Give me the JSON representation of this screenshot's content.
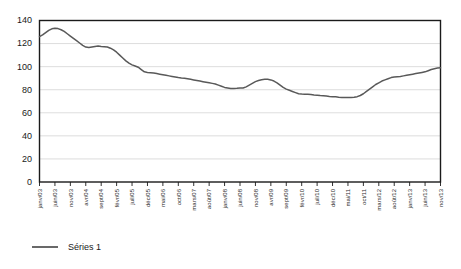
{
  "chart_data": {
    "type": "line",
    "title": "",
    "subtitle": "",
    "xlabel": "",
    "ylabel": "",
    "ylim": [
      0,
      140
    ],
    "yticks": [
      0,
      20,
      40,
      60,
      80,
      100,
      120,
      140
    ],
    "grid": true,
    "legend_position": "bottom-left",
    "x_tick_labels": [
      "janv/03",
      "juin/03",
      "nov/03",
      "avr/04",
      "sept/04",
      "févr/05",
      "juil/05",
      "déc/05",
      "mai/06",
      "oct/06",
      "mars/07",
      "août/07",
      "janv/08",
      "juin/08",
      "nov/08",
      "avr/09",
      "sept/09",
      "févr/10",
      "juil/10",
      "déc/10",
      "mai/11",
      "oct/11",
      "mars/12",
      "août/12",
      "janv/13",
      "juin/13",
      "nov/13"
    ],
    "x_tick_interval_months": 5,
    "series": [
      {
        "name": "Séries 1",
        "color": "#595959",
        "values": [
          126,
          127.5,
          129.5,
          131.5,
          132.8,
          133.2,
          133,
          132,
          130.5,
          128.5,
          126.5,
          124.5,
          122.5,
          120.5,
          118.5,
          117,
          116.5,
          117,
          117.5,
          117.8,
          117.5,
          117.3,
          117,
          116,
          114.5,
          112.5,
          110,
          107.5,
          105,
          103,
          101.5,
          100.5,
          99.5,
          97.5,
          95.5,
          95,
          94.8,
          94.5,
          94,
          93.5,
          93,
          92.5,
          92,
          91.5,
          91,
          90.5,
          90.2,
          90,
          89.5,
          89,
          88.5,
          88,
          87.5,
          87,
          86.5,
          86,
          85.5,
          85,
          84,
          83,
          82,
          81.5,
          81,
          81,
          81.2,
          81.5,
          81.5,
          82.5,
          84,
          85.5,
          87,
          88,
          88.7,
          89,
          89,
          88.5,
          87.5,
          86,
          84,
          82,
          80.5,
          79.5,
          78.5,
          77.5,
          76.5,
          76.2,
          76,
          76,
          75.8,
          75.5,
          75.3,
          75,
          74.8,
          74.5,
          74.2,
          74,
          73.8,
          73.5,
          73.3,
          73.2,
          73.2,
          73.3,
          73.5,
          74,
          75,
          76.5,
          78.5,
          80.5,
          82.5,
          84.5,
          86,
          87.5,
          88.5,
          89.5,
          90.5,
          91,
          91.3,
          91.5,
          92,
          92.5,
          93,
          93.5,
          94,
          94.5,
          95,
          95.5,
          96.5,
          97.5,
          98.2,
          98.8,
          99
        ]
      }
    ]
  },
  "legend": {
    "entries": [
      {
        "label": "Séries 1",
        "color": "#595959"
      }
    ]
  },
  "axes": {
    "y_axis_name": "value-axis",
    "x_axis_name": "time-axis"
  }
}
